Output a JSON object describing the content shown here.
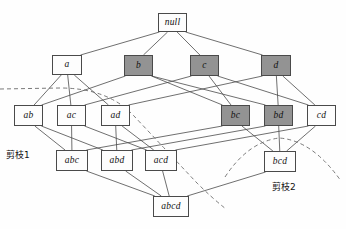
{
  "figure": {
    "title": "",
    "type": "lattice-diagram",
    "background_color": "#fefefe",
    "shaded_fill": "#939393",
    "plain_fill": "#fdfdfd",
    "stroke_color": "#4a4a4a",
    "dashed_color": "#6b6b6b"
  },
  "nodes": [
    {
      "id": "null",
      "label": "null",
      "shaded": false,
      "x": 158,
      "y": 13,
      "w": 29,
      "h": 19
    },
    {
      "id": "a",
      "label": "a",
      "shaded": false,
      "x": 52,
      "y": 55,
      "w": 30,
      "h": 20
    },
    {
      "id": "b",
      "label": "b",
      "shaded": true,
      "x": 124,
      "y": 55,
      "w": 29,
      "h": 21
    },
    {
      "id": "c",
      "label": "c",
      "shaded": true,
      "x": 190,
      "y": 55,
      "w": 29,
      "h": 21
    },
    {
      "id": "d",
      "label": "d",
      "shaded": true,
      "x": 261,
      "y": 55,
      "w": 30,
      "h": 21
    },
    {
      "id": "ab",
      "label": "ab",
      "shaded": false,
      "x": 14,
      "y": 105,
      "w": 29,
      "h": 21
    },
    {
      "id": "ac",
      "label": "ac",
      "shaded": false,
      "x": 57,
      "y": 105,
      "w": 29,
      "h": 21
    },
    {
      "id": "ad",
      "label": "ad",
      "shaded": false,
      "x": 101,
      "y": 105,
      "w": 29,
      "h": 21
    },
    {
      "id": "bc",
      "label": "bc",
      "shaded": true,
      "x": 221,
      "y": 105,
      "w": 29,
      "h": 21
    },
    {
      "id": "bd",
      "label": "bd",
      "shaded": true,
      "x": 264,
      "y": 105,
      "w": 29,
      "h": 21
    },
    {
      "id": "cd",
      "label": "cd",
      "shaded": false,
      "x": 307,
      "y": 105,
      "w": 29,
      "h": 21
    },
    {
      "id": "abc",
      "label": "abc",
      "shaded": false,
      "x": 56,
      "y": 150,
      "w": 32,
      "h": 21
    },
    {
      "id": "abd",
      "label": "abd",
      "shaded": false,
      "x": 101,
      "y": 150,
      "w": 32,
      "h": 21
    },
    {
      "id": "acd",
      "label": "acd",
      "shaded": false,
      "x": 145,
      "y": 150,
      "w": 32,
      "h": 21
    },
    {
      "id": "bcd",
      "label": "bcd",
      "shaded": false,
      "x": 264,
      "y": 151,
      "w": 32,
      "h": 21
    },
    {
      "id": "abcd",
      "label": "abcd",
      "shaded": false,
      "x": 153,
      "y": 196,
      "w": 36,
      "h": 21
    }
  ],
  "edges": [
    [
      "null",
      "a"
    ],
    [
      "null",
      "b"
    ],
    [
      "null",
      "c"
    ],
    [
      "null",
      "d"
    ],
    [
      "a",
      "ab"
    ],
    [
      "a",
      "ac"
    ],
    [
      "a",
      "ad"
    ],
    [
      "b",
      "ab"
    ],
    [
      "b",
      "bc"
    ],
    [
      "b",
      "bd"
    ],
    [
      "c",
      "ac"
    ],
    [
      "c",
      "bc"
    ],
    [
      "c",
      "cd"
    ],
    [
      "d",
      "ad"
    ],
    [
      "d",
      "bd"
    ],
    [
      "d",
      "cd"
    ],
    [
      "ab",
      "abc"
    ],
    [
      "ab",
      "abd"
    ],
    [
      "ac",
      "abc"
    ],
    [
      "ac",
      "acd"
    ],
    [
      "ad",
      "abd"
    ],
    [
      "ad",
      "acd"
    ],
    [
      "bc",
      "abc"
    ],
    [
      "bc",
      "bcd"
    ],
    [
      "bd",
      "abd"
    ],
    [
      "bd",
      "bcd"
    ],
    [
      "cd",
      "acd"
    ],
    [
      "cd",
      "bcd"
    ],
    [
      "abc",
      "abcd"
    ],
    [
      "abd",
      "abcd"
    ],
    [
      "acd",
      "abcd"
    ],
    [
      "bcd",
      "abcd"
    ]
  ],
  "annotations": [
    {
      "id": "prune-1",
      "label": "剪枝1",
      "x": 6,
      "y": 148
    },
    {
      "id": "prune-2",
      "label": "剪枝2",
      "x": 272,
      "y": 180
    }
  ],
  "prune_curves": [
    {
      "id": "prune-curve-1",
      "path": "M 0,89 L 60,88 Q 108,88 134,116 Q 166,150 196,182 Q 212,198 226,209"
    },
    {
      "id": "prune-curve-2",
      "path": "M 225,177 Q 248,142 279,138 Q 312,140 341,181"
    }
  ]
}
